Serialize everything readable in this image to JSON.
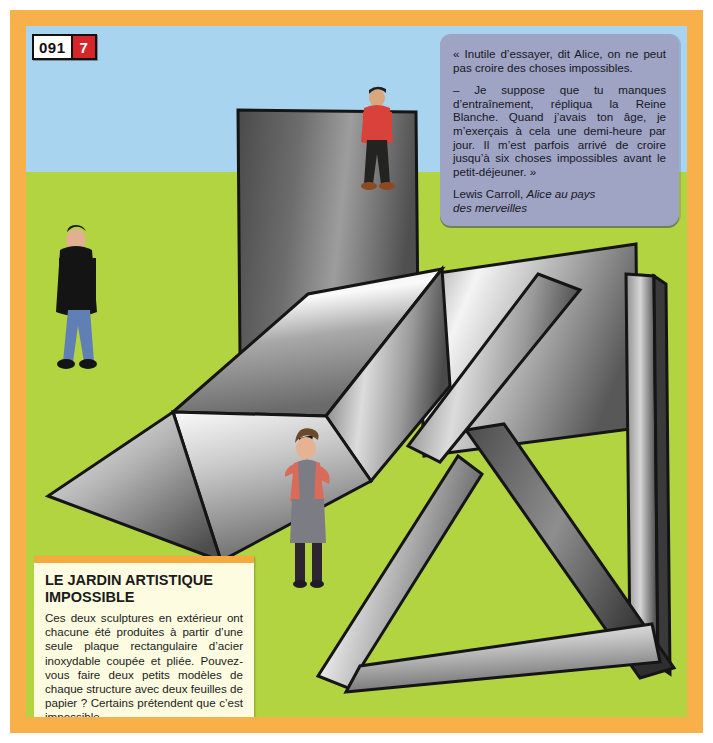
{
  "page": {
    "number": "091",
    "section": "7"
  },
  "colors": {
    "frame_orange": "#f8b14a",
    "sky_blue": "#a9d4ef",
    "grass_green": "#b2d440",
    "badge_red": "#d8252a",
    "quote_bg": "#9fa3c4",
    "quote_top_bar": "#6f7596",
    "caption_bg": "#fdfce0",
    "caption_top_bar": "#f5a93e",
    "steel_light": "#f2f2f2",
    "steel_mid": "#9a9a9a",
    "steel_dark": "#3a3a3a",
    "outline": "#1a1a1a",
    "shirt_red": "#d8423a",
    "jeans_blue": "#5f7fb5",
    "jacket_black": "#141414",
    "woman_top_salmon": "#d96b5a",
    "woman_grey": "#7c7c84"
  },
  "quote": {
    "paragraphs": [
      "« Inutile d’essayer, dit Alice, on ne peut pas croire des choses impossibles.",
      "– Je suppose que tu manques d’entraînement, répliqua la Reine Blanche. Quand j’avais ton âge, je m’exerçais à cela une demi-heure par jour. Il m’est parfois arrivé de croire jusqu’à six choses impossibles avant le petit-déjeuner. »"
    ],
    "author": "Lewis Carroll, ",
    "work_line1": "Alice au pays",
    "work_line2": "des merveilles"
  },
  "caption": {
    "title_line1": "LE JARDIN ARTISTIQUE",
    "title_line2": "IMPOSSIBLE",
    "body": "Ces deux sculptures en extérieur ont chacune été produites à partir d’une seule plaque rectangulaire d’acier inoxydable coupée et pliée. Pouvez-vous faire deux petits modèles de chaque structure avec deux feuilles de papier ? Certains prétendent que c’est impossible."
  },
  "scene": {
    "horizon_label": "horizon",
    "sculptures": [
      {
        "name": "upper-impossible-folded-plate",
        "description": "Large folded stainless-steel plate sculpture, upper-left to centre"
      },
      {
        "name": "lower-impossible-triangle",
        "description": "Folded steel strip forming an impossible triangle, lower-right"
      }
    ],
    "figures": [
      {
        "name": "man-in-black-jacket",
        "clothing": "black jacket, blue jeans, black shoes"
      },
      {
        "name": "man-in-red-shirt",
        "clothing": "red t-shirt, dark cap, black trousers, brown shoes"
      },
      {
        "name": "woman-with-hand-on-hip",
        "clothing": "salmon top, grey vest and skirt, dark boots"
      }
    ]
  }
}
